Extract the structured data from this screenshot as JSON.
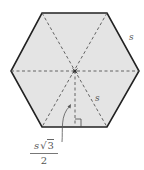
{
  "diagram": {
    "shape": "regular hexagon",
    "fill_color": "#e4e4e4",
    "edge_color": "#222222",
    "dash_color": "#555555",
    "labels": {
      "side_label": "s",
      "radius_label": "s",
      "apothem_numerator_var": "s",
      "apothem_numerator_radical": "√",
      "apothem_numerator_radicand": "3",
      "apothem_denominator": "2"
    },
    "annotations": {
      "center_point": "center",
      "right_angle_marker": "right angle at apothem foot",
      "arrow": "curved arrow pointing to apothem"
    }
  }
}
